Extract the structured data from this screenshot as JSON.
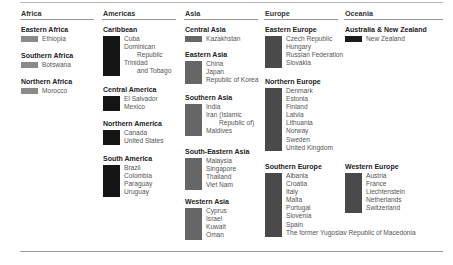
{
  "colors": {
    "africa": "#8a8a8a",
    "americas": "#151515",
    "asia": "#666666",
    "europe": "#4a4a4a",
    "oceania": "#1a1a1a",
    "rule": "#999999"
  },
  "columns": [
    {
      "title": "Africa",
      "groups": [
        {
          "title": "Eastern Africa",
          "items": [
            "Ethiopia"
          ]
        },
        {
          "title": "Southern Africa",
          "items": [
            "Botswana"
          ]
        },
        {
          "title": "Northern Africa",
          "items": [
            "Morocco"
          ]
        }
      ]
    },
    {
      "title": "Americas",
      "groups": [
        {
          "title": "Caribbean",
          "items": [
            "Cuba",
            "Dominican",
            "Republic",
            "Trinidad",
            "and Tobago"
          ]
        },
        {
          "title": "Central America",
          "items": [
            "El Salvador",
            "Mexico"
          ]
        },
        {
          "title": "Northern America",
          "items": [
            "Canada",
            "United States"
          ]
        },
        {
          "title": "South America",
          "items": [
            "Brazil",
            "Colombia",
            "Paraguay",
            "Uruguay"
          ]
        }
      ]
    },
    {
      "title": "Asia",
      "groups": [
        {
          "title": "Central Asia",
          "items": [
            "Kazakhstan"
          ]
        },
        {
          "title": "Eastern Asia",
          "items": [
            "China",
            "Japan",
            "Republic of Korea"
          ]
        },
        {
          "title": "Southern Asia",
          "items": [
            "India",
            "Iran (Islamic",
            "Republic of)",
            "Maldives"
          ]
        },
        {
          "title": "South-Eastern Asia",
          "items": [
            "Malaysia",
            "Singapore",
            "Thailand",
            "Viet Nam"
          ]
        },
        {
          "title": "Western Asia",
          "items": [
            "Cyprus",
            "Israel",
            "Kuwait",
            "Oman"
          ]
        }
      ]
    },
    {
      "title": "Europe",
      "groups": [
        {
          "title": "Eastern Europe",
          "items": [
            "Czech Republic",
            "Hungary",
            "Russian Federation",
            "Slovakia"
          ]
        },
        {
          "title": "Northern Europe",
          "items": [
            "Denmark",
            "Estonia",
            "Finland",
            "Latvia",
            "Lithuania",
            "Norway",
            "Sweden",
            "United Kingdom"
          ]
        },
        {
          "title": "Southern Europe",
          "items": [
            "Albania",
            "Croatia",
            "Italy",
            "Malta",
            "Portugal",
            "Slovenia",
            "Spain",
            "The former Yugoslav Republic of Macedonia"
          ]
        }
      ]
    },
    {
      "title": "Oceania",
      "groups": [
        {
          "title": "Australia & New Zealand",
          "items": [
            "New Zealand"
          ]
        },
        {
          "title": "Western Europe",
          "items": [
            "Austria",
            "France",
            "Liechtenstein",
            "Netherlands",
            "Switzerland"
          ]
        }
      ]
    }
  ]
}
